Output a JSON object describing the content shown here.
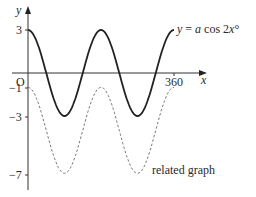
{
  "chart_data": {
    "type": "line",
    "title": "",
    "xlabel": "x",
    "ylabel": "y",
    "origin_label": "O",
    "x_ticks": [
      360
    ],
    "y_ticks": [
      3,
      -1,
      -3,
      -7
    ],
    "xlim": [
      0,
      360
    ],
    "ylim": [
      -7,
      3
    ],
    "grid": false,
    "series": [
      {
        "name": "y = a cos 2x°",
        "style": "solid",
        "formula": "3cos(2x)",
        "x": [
          0,
          45,
          90,
          135,
          180,
          225,
          270,
          315,
          360
        ],
        "values": [
          3,
          0,
          -3,
          0,
          3,
          0,
          -3,
          0,
          3
        ]
      },
      {
        "name": "related graph",
        "style": "dashed",
        "formula": "3cos(2x) - 4",
        "x": [
          0,
          45,
          90,
          135,
          180,
          225,
          270,
          315,
          360
        ],
        "values": [
          -1,
          -4,
          -7,
          -4,
          -1,
          -4,
          -7,
          -4,
          -1
        ]
      }
    ],
    "annotations": [
      {
        "text": "y = a cos 2x°",
        "near": "solid curve end"
      },
      {
        "text": "related graph",
        "near": "dashed curve second trough"
      }
    ]
  },
  "labels": {
    "y_axis": "y",
    "x_axis": "x",
    "origin": "O",
    "tick_360": "360",
    "tick_3": "3",
    "tick_m1": "−1",
    "tick_m3": "−3",
    "tick_m7": "−7",
    "curve_label_a": "y = ",
    "curve_label_b": "a",
    "curve_label_c": " cos 2",
    "curve_label_d": "x",
    "curve_label_e": "°",
    "related_label": "related graph"
  }
}
